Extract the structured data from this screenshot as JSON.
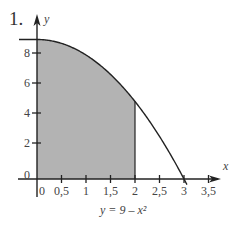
{
  "problem_number": "1.",
  "equation_label": "y = 9 – x²",
  "colors": {
    "shade": "#b3b3b3",
    "axis": "#222222",
    "curve": "#222222",
    "background": "#ffffff"
  },
  "chart_data": {
    "type": "area",
    "title": "",
    "function": "y = 9 - x^2",
    "xlabel": "x",
    "ylabel": "y",
    "xlim": [
      0,
      3.5
    ],
    "ylim": [
      0,
      9
    ],
    "x_ticks": [
      "0",
      "0,5",
      "1",
      "1,5",
      "2",
      "2,5",
      "3",
      "3,5"
    ],
    "x_tick_values": [
      0,
      0.5,
      1,
      1.5,
      2,
      2.5,
      3,
      3.5
    ],
    "y_ticks": [
      "0",
      "2",
      "4",
      "6",
      "8"
    ],
    "y_tick_values": [
      0,
      2,
      4,
      6,
      8
    ],
    "shaded_region": {
      "x_from": 0,
      "x_to": 2,
      "description": "area under y = 9 - x^2 from x = 0 to x = 2"
    },
    "curve_points": [
      {
        "x": 0,
        "y": 9
      },
      {
        "x": 0.5,
        "y": 8.75
      },
      {
        "x": 1,
        "y": 8
      },
      {
        "x": 1.5,
        "y": 6.75
      },
      {
        "x": 2,
        "y": 5
      },
      {
        "x": 2.5,
        "y": 2.75
      },
      {
        "x": 3,
        "y": 0
      }
    ],
    "grid": false,
    "legend": null,
    "annotations": [
      "y = 9 – x²"
    ]
  }
}
